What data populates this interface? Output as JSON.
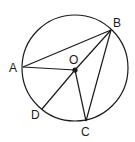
{
  "diagram": {
    "type": "circle-geometry",
    "stroke_color": "#1a1a1a",
    "background": "#ffffff",
    "circle": {
      "cx": 75,
      "cy": 68,
      "r": 53
    },
    "points": {
      "A": {
        "x": 23,
        "y": 67,
        "label": "A",
        "lx": 9,
        "ly": 72
      },
      "B": {
        "x": 111,
        "y": 30,
        "label": "B",
        "lx": 113,
        "ly": 27
      },
      "C": {
        "x": 86,
        "y": 121,
        "label": "C",
        "lx": 81,
        "ly": 136
      },
      "D": {
        "x": 42,
        "y": 109,
        "label": "D",
        "lx": 31,
        "ly": 119
      },
      "O": {
        "x": 75,
        "y": 70,
        "label": "O",
        "lx": 69,
        "ly": 64
      }
    },
    "segments": [
      [
        "A",
        "B"
      ],
      [
        "A",
        "O"
      ],
      [
        "O",
        "B"
      ],
      [
        "O",
        "C"
      ],
      [
        "O",
        "D"
      ],
      [
        "B",
        "C"
      ]
    ]
  }
}
